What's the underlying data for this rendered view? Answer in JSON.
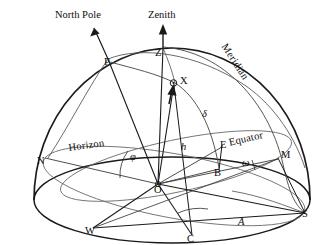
{
  "figure": {
    "kind": "celestial-sphere-diagram",
    "background_color": "#ffffff",
    "stroke_color": "#1a1a1a",
    "light_stroke_color": "#555555",
    "width": 334,
    "height": 245
  },
  "axis_labels": {
    "north_pole": "North Pole",
    "zenith": "Zenith"
  },
  "great_circle_labels": {
    "meridian": "Meridian",
    "equator": "Equator",
    "horizon": "Horizon"
  },
  "points": [
    {
      "id": "P",
      "label": "P",
      "x": 104,
      "y": 63,
      "desc": "north-celestial-pole-on-sphere"
    },
    {
      "id": "Z",
      "label": "Z",
      "x": 155,
      "y": 54,
      "desc": "zenith-on-sphere"
    },
    {
      "id": "X",
      "label": "X",
      "x": 180,
      "y": 82,
      "desc": "star"
    },
    {
      "id": "N",
      "label": "N",
      "x": 38,
      "y": 162,
      "desc": "north-cardinal-point"
    },
    {
      "id": "E",
      "label": "E",
      "x": 221,
      "y": 147,
      "desc": "east-cardinal-point"
    },
    {
      "id": "B",
      "label": "B",
      "x": 215,
      "y": 174,
      "desc": "foot-of-declination-arc"
    },
    {
      "id": "M",
      "label": "M",
      "x": 281,
      "y": 157,
      "desc": "meridian-equator-intersection"
    },
    {
      "id": "O",
      "label": "O",
      "x": 155,
      "y": 191,
      "desc": "observer-origin"
    },
    {
      "id": "W",
      "label": "W",
      "x": 86,
      "y": 232,
      "desc": "west-cardinal-point"
    },
    {
      "id": "C",
      "label": "C",
      "x": 188,
      "y": 240,
      "desc": "foot-of-altitude-perpendicular"
    },
    {
      "id": "S",
      "label": "S",
      "x": 303,
      "y": 216,
      "desc": "south-cardinal-point"
    }
  ],
  "angle_labels": [
    {
      "id": "phi",
      "symbol": "φ",
      "x": 131,
      "y": 158,
      "desc": "observer-latitude"
    },
    {
      "id": "delta",
      "symbol": "δ",
      "x": 203,
      "y": 115,
      "desc": "declination"
    },
    {
      "id": "h",
      "symbol": "h",
      "x": 182,
      "y": 148,
      "desc": "altitude"
    },
    {
      "id": "omega",
      "symbol": "ω",
      "x": 243,
      "y": 164,
      "desc": "hour-angle"
    },
    {
      "id": "A",
      "symbol": "A",
      "x": 239,
      "y": 223,
      "desc": "azimuth"
    }
  ]
}
